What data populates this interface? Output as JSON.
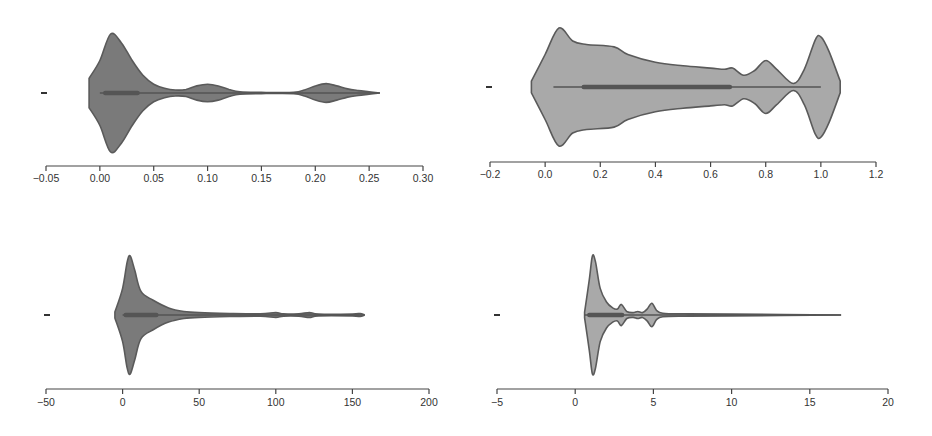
{
  "figure": {
    "layout": "2x2 grid of horizontal violin plots",
    "colors": {
      "violin_fill_dark": "#7a7a7a",
      "violin_fill_light": "#a9a9a9",
      "outline": "#5a5a5a",
      "box": "#555555",
      "axis": "#444444",
      "text": "#333333",
      "background": "#ffffff"
    }
  },
  "chart_data": [
    {
      "type": "violin",
      "panel": "top-left",
      "title": "",
      "xlabel": "",
      "ylabel": "",
      "y_tick_labels": [
        "-"
      ],
      "x_ticks": [
        -0.05,
        0.0,
        0.05,
        0.1,
        0.15,
        0.2,
        0.25,
        0.3
      ],
      "x_tick_labels": [
        "-0.05",
        "0.00",
        "0.05",
        "0.10",
        "0.15",
        "0.20",
        "0.25",
        "0.30"
      ],
      "xlim": [
        -0.05,
        0.3
      ],
      "fill": "#7a7a7a",
      "range": [
        -0.01,
        0.26
      ],
      "density_profile": [
        [
          -0.01,
          0.25
        ],
        [
          0.0,
          0.55
        ],
        [
          0.01,
          1.0
        ],
        [
          0.02,
          0.85
        ],
        [
          0.03,
          0.55
        ],
        [
          0.04,
          0.3
        ],
        [
          0.05,
          0.15
        ],
        [
          0.06,
          0.08
        ],
        [
          0.07,
          0.05
        ],
        [
          0.08,
          0.06
        ],
        [
          0.09,
          0.12
        ],
        [
          0.1,
          0.15
        ],
        [
          0.11,
          0.12
        ],
        [
          0.12,
          0.06
        ],
        [
          0.13,
          0.02
        ],
        [
          0.15,
          0.01
        ],
        [
          0.18,
          0.01
        ],
        [
          0.19,
          0.05
        ],
        [
          0.2,
          0.12
        ],
        [
          0.21,
          0.16
        ],
        [
          0.22,
          0.12
        ],
        [
          0.23,
          0.07
        ],
        [
          0.24,
          0.04
        ],
        [
          0.25,
          0.02
        ],
        [
          0.26,
          0.0
        ]
      ],
      "box": {
        "q1": 0.005,
        "median": 0.02,
        "q3": 0.035,
        "whisker_low": 0.0,
        "whisker_high": 0.26
      }
    },
    {
      "type": "violin",
      "panel": "top-right",
      "title": "",
      "xlabel": "",
      "ylabel": "",
      "y_tick_labels": [
        "-"
      ],
      "x_ticks": [
        -0.2,
        0.0,
        0.2,
        0.4,
        0.6,
        0.8,
        1.0,
        1.2
      ],
      "x_tick_labels": [
        "-0.2",
        "0.0",
        "0.2",
        "0.4",
        "0.6",
        "0.8",
        "1.0",
        "1.2"
      ],
      "xlim": [
        -0.2,
        1.2
      ],
      "fill": "#a9a9a9",
      "range": [
        -0.05,
        1.07
      ],
      "density_profile": [
        [
          -0.05,
          0.1
        ],
        [
          0.0,
          0.55
        ],
        [
          0.05,
          1.0
        ],
        [
          0.1,
          0.78
        ],
        [
          0.15,
          0.72
        ],
        [
          0.25,
          0.68
        ],
        [
          0.3,
          0.55
        ],
        [
          0.4,
          0.42
        ],
        [
          0.5,
          0.36
        ],
        [
          0.6,
          0.32
        ],
        [
          0.65,
          0.3
        ],
        [
          0.68,
          0.32
        ],
        [
          0.72,
          0.2
        ],
        [
          0.76,
          0.28
        ],
        [
          0.8,
          0.45
        ],
        [
          0.84,
          0.3
        ],
        [
          0.9,
          0.06
        ],
        [
          0.94,
          0.3
        ],
        [
          0.98,
          0.8
        ],
        [
          1.0,
          0.85
        ],
        [
          1.03,
          0.6
        ],
        [
          1.07,
          0.1
        ]
      ],
      "box": {
        "q1": 0.14,
        "median": 0.4,
        "q3": 0.67,
        "whisker_low": 0.03,
        "whisker_high": 1.0
      }
    },
    {
      "type": "violin",
      "panel": "bottom-left",
      "title": "",
      "xlabel": "",
      "ylabel": "",
      "y_tick_labels": [
        "-"
      ],
      "x_ticks": [
        -50,
        0,
        50,
        100,
        150,
        200
      ],
      "x_tick_labels": [
        "-50",
        "0",
        "50",
        "100",
        "150",
        "200"
      ],
      "xlim": [
        -50,
        200
      ],
      "fill": "#7a7a7a",
      "range": [
        -5,
        158
      ],
      "density_profile": [
        [
          -5,
          0.05
        ],
        [
          0,
          0.45
        ],
        [
          3,
          0.9
        ],
        [
          5,
          1.0
        ],
        [
          8,
          0.75
        ],
        [
          12,
          0.4
        ],
        [
          20,
          0.25
        ],
        [
          30,
          0.12
        ],
        [
          40,
          0.06
        ],
        [
          50,
          0.04
        ],
        [
          70,
          0.025
        ],
        [
          90,
          0.02
        ],
        [
          100,
          0.04
        ],
        [
          105,
          0.02
        ],
        [
          115,
          0.02
        ],
        [
          122,
          0.04
        ],
        [
          128,
          0.015
        ],
        [
          150,
          0.015
        ],
        [
          155,
          0.025
        ],
        [
          158,
          0.0
        ]
      ],
      "box": {
        "q1": 2,
        "median": 10,
        "q3": 22,
        "whisker_low": 0,
        "whisker_high": 158
      }
    },
    {
      "type": "violin",
      "panel": "bottom-right",
      "title": "",
      "xlabel": "",
      "ylabel": "",
      "y_tick_labels": [
        "-"
      ],
      "x_ticks": [
        -5,
        0,
        5,
        10,
        15,
        20
      ],
      "x_tick_labels": [
        "-5",
        "0",
        "5",
        "10",
        "15",
        "20"
      ],
      "xlim": [
        -5,
        20
      ],
      "fill": "#a9a9a9",
      "range": [
        0.6,
        17
      ],
      "density_profile": [
        [
          0.6,
          0.05
        ],
        [
          0.9,
          0.6
        ],
        [
          1.1,
          1.0
        ],
        [
          1.3,
          0.9
        ],
        [
          1.6,
          0.45
        ],
        [
          2.0,
          0.22
        ],
        [
          2.4,
          0.12
        ],
        [
          2.7,
          0.1
        ],
        [
          2.95,
          0.18
        ],
        [
          3.3,
          0.06
        ],
        [
          3.7,
          0.04
        ],
        [
          4.0,
          0.06
        ],
        [
          4.3,
          0.04
        ],
        [
          4.6,
          0.1
        ],
        [
          4.9,
          0.2
        ],
        [
          5.2,
          0.08
        ],
        [
          5.6,
          0.03
        ],
        [
          7,
          0.02
        ],
        [
          10,
          0.015
        ],
        [
          17,
          0.0
        ]
      ],
      "box": {
        "q1": 0.9,
        "median": 1.4,
        "q3": 3.0,
        "whisker_low": 0.6,
        "whisker_high": 17
      }
    }
  ]
}
